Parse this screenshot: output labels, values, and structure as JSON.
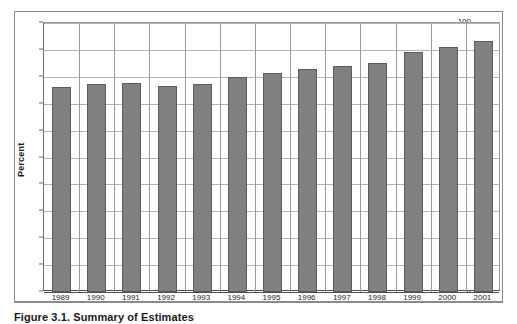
{
  "figure": {
    "caption": "Figure 3.1.  Summary of Estimates"
  },
  "chart_data": {
    "type": "bar",
    "title": "",
    "subtitle": "",
    "xlabel": "",
    "ylabel": "Percent",
    "categories": [
      "1989",
      "1990",
      "1991",
      "1992",
      "1993",
      "1994",
      "1995",
      "1996",
      "1997",
      "1998",
      "1999",
      "2000",
      "2001"
    ],
    "values": [
      76.3,
      77.3,
      77.7,
      76.4,
      77.4,
      79.8,
      81.5,
      83.0,
      83.9,
      85.3,
      89.2,
      91.0,
      93.2
    ],
    "ylim": [
      0,
      100
    ],
    "ytick_step": 10,
    "yticks": [
      0,
      10,
      20,
      30,
      40,
      50,
      60,
      70,
      80,
      90,
      100
    ],
    "grid": true,
    "legend": false,
    "legend_position": "none",
    "series_color": "#808080",
    "gridline_color": "#b4b4b4",
    "axis_color": "#4d4d4d"
  }
}
